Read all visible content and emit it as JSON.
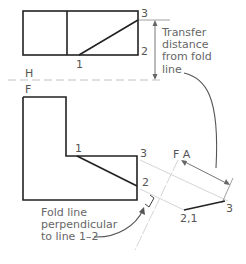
{
  "diagram": {
    "fold_lines": {
      "hf": {
        "upper": "H",
        "lower": "F"
      },
      "fa": "F A"
    },
    "points": {
      "top_view": {
        "p1": "1",
        "p2": "2",
        "p3": "3"
      },
      "front_view": {
        "p1": "1",
        "p2": "2",
        "p3": "3"
      },
      "aux_view": {
        "p21": "2,1",
        "p3": "3"
      }
    },
    "annotations": {
      "transfer": [
        "Transfer",
        "distance",
        "from fold",
        "line"
      ],
      "fold_perp": [
        "Fold line",
        "perpendicular",
        "to line 1–2"
      ]
    },
    "colors": {
      "object_line": "#222222",
      "construction": "#cfcfcf",
      "dim_line": "#666666",
      "text": "#555555"
    }
  }
}
